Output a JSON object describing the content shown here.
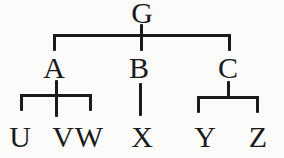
{
  "figure": {
    "type": "tree-diagram",
    "ink": "#1a1a1a",
    "paper": "#fbfbfa",
    "nodes": {
      "g": {
        "label": "G"
      },
      "a": {
        "label": "A"
      },
      "b": {
        "label": "B"
      },
      "c": {
        "label": "C"
      },
      "u": {
        "label": "U"
      },
      "v": {
        "label": "V"
      },
      "w": {
        "label": "W"
      },
      "x": {
        "label": "X"
      },
      "y": {
        "label": "Y"
      },
      "z": {
        "label": "Z"
      }
    },
    "edges": [
      {
        "from": "G",
        "to": "A"
      },
      {
        "from": "G",
        "to": "B"
      },
      {
        "from": "G",
        "to": "C"
      },
      {
        "from": "A",
        "to": "U"
      },
      {
        "from": "A",
        "to": "V"
      },
      {
        "from": "A",
        "to": "W"
      },
      {
        "from": "B",
        "to": "X"
      },
      {
        "from": "C",
        "to": "Y"
      },
      {
        "from": "C",
        "to": "Z"
      }
    ]
  }
}
